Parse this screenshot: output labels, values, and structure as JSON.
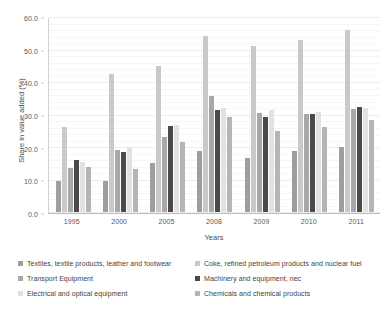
{
  "chart_data": {
    "type": "bar",
    "title": "",
    "xlabel": "Years",
    "ylabel": "Share in value added (%)",
    "categories": [
      "1995",
      "2000",
      "2005",
      "2008",
      "2009",
      "2010",
      "2011"
    ],
    "ylim": [
      0.0,
      60.0
    ],
    "yticks": [
      "0.0",
      "10.0",
      "20.0",
      "30.0",
      "40.0",
      "50.0",
      "60.0"
    ],
    "ytick_values": [
      0,
      10,
      20,
      30,
      40,
      50,
      60
    ],
    "grid": true,
    "legend_position": "bottom",
    "series": [
      {
        "name": "Textiles, textile products, leather and footwear",
        "color": "#9e9e9e",
        "values": [
          9.6,
          9.5,
          15.2,
          18.9,
          16.7,
          18.8,
          20.2
        ]
      },
      {
        "name": "Coke, refined petroleum products and nuclear fuel",
        "color": "#c9c9c9",
        "values": [
          26.4,
          42.6,
          45.2,
          54.3,
          51.2,
          53.1,
          56.4
        ]
      },
      {
        "name": "Transport Equipment",
        "color": "#a8a8a8",
        "values": [
          13.7,
          19.1,
          23.1,
          35.8,
          30.6,
          30.4,
          31.8
        ]
      },
      {
        "name": "Machinery and equipment, nec",
        "color": "#4a4a4a",
        "values": [
          16.1,
          18.5,
          26.7,
          31.5,
          29.4,
          30.2,
          32.6
        ]
      },
      {
        "name": "Electrical and optical equipment",
        "color": "#e2e2e2",
        "values": [
          15.4,
          20.1,
          26.9,
          32.2,
          31.7,
          30.9,
          32.2
        ]
      },
      {
        "name": "Chemicals and chemical products",
        "color": "#b5b5b5",
        "values": [
          13.8,
          13.4,
          21.6,
          29.3,
          25.0,
          26.4,
          28.5
        ]
      }
    ]
  }
}
